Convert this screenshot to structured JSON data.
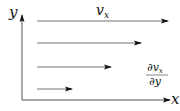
{
  "diagram": {
    "colors": {
      "axis": "#555555",
      "arrow": "#707070",
      "arrowhead": "#111111",
      "text": "#111111"
    },
    "axes": {
      "x_label": "x",
      "y_label": "y",
      "origin": [
        22,
        100
      ],
      "x_end": 170,
      "y_end": 15
    },
    "velocity_arrows": [
      {
        "y": 21,
        "x_start": 37,
        "x_end": 168
      },
      {
        "y": 43,
        "x_start": 37,
        "x_end": 141
      },
      {
        "y": 67,
        "x_start": 37,
        "x_end": 111
      },
      {
        "y": 89,
        "x_start": 37,
        "x_end": 72
      }
    ],
    "labels": {
      "velocity": {
        "base": "v",
        "subscript": "x"
      },
      "gradient": {
        "numerator": {
          "prefix": "∂",
          "base": "v",
          "subscript": "x"
        },
        "denominator": "∂y"
      }
    }
  }
}
